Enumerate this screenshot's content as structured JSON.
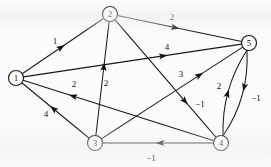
{
  "figure": {
    "type": "directed-weighted-graph",
    "background_color": "#fbfbfb",
    "ink_color": "#18181a",
    "width": 271,
    "height": 167
  },
  "chart_data": {
    "type": "diagram",
    "subtype": "directed-weighted-graph",
    "title": "",
    "xlabel": "",
    "ylabel": "",
    "directed": true,
    "weighted": true,
    "node_radius": 7.5,
    "nodes": [
      {
        "id": "1",
        "label": "1",
        "x": 16,
        "y": 78
      },
      {
        "id": "2",
        "label": "2",
        "x": 110,
        "y": 14
      },
      {
        "id": "3",
        "label": "3",
        "x": 95,
        "y": 143
      },
      {
        "id": "4",
        "label": "4",
        "x": 221,
        "y": 143
      },
      {
        "id": "5",
        "label": "5",
        "x": 249,
        "y": 43
      }
    ],
    "edges": [
      {
        "from": "1",
        "to": "2",
        "weight": "1",
        "label_x": 55,
        "label_y": 41,
        "curve": 0,
        "arrow_t": 0.52
      },
      {
        "from": "1",
        "to": "5",
        "weight": "4",
        "label_x": 167,
        "label_y": 47,
        "curve": 0,
        "arrow_t": 0.66
      },
      {
        "from": "2",
        "to": "5",
        "weight": "2",
        "label_x": 172,
        "label_y": 17,
        "curve": 0,
        "arrow_t": 0.5
      },
      {
        "from": "2",
        "to": "4",
        "weight": "-1",
        "label_x": 200,
        "label_y": 104,
        "curve": 0,
        "arrow_t": 0.72
      },
      {
        "from": "3",
        "to": "2",
        "weight": "2",
        "label_x": 106,
        "label_y": 83,
        "curve": 0,
        "arrow_t": 0.64
      },
      {
        "from": "3",
        "to": "1",
        "weight": "4",
        "label_x": 46,
        "label_y": 114,
        "curve": 0,
        "arrow_t": 0.58
      },
      {
        "from": "3",
        "to": "5",
        "weight": "3",
        "label_x": 181,
        "label_y": 74,
        "curve": 0,
        "arrow_t": 0.72
      },
      {
        "from": "4",
        "to": "1",
        "weight": "2",
        "label_x": 74,
        "label_y": 84,
        "curve": 0,
        "arrow_t": 0.76
      },
      {
        "from": "4",
        "to": "3",
        "weight": "-1",
        "label_x": 151,
        "label_y": 158,
        "curve": 0,
        "arrow_t": 0.52
      },
      {
        "from": "5",
        "to": "4",
        "weight": "2",
        "label_x": 219,
        "label_y": 86,
        "curve": -15,
        "arrow_t": 0.46
      },
      {
        "from": "4",
        "to": "5",
        "weight": "-1",
        "label_x": 256,
        "label_y": 98,
        "curve": -14,
        "arrow_t": 0.52
      }
    ]
  }
}
